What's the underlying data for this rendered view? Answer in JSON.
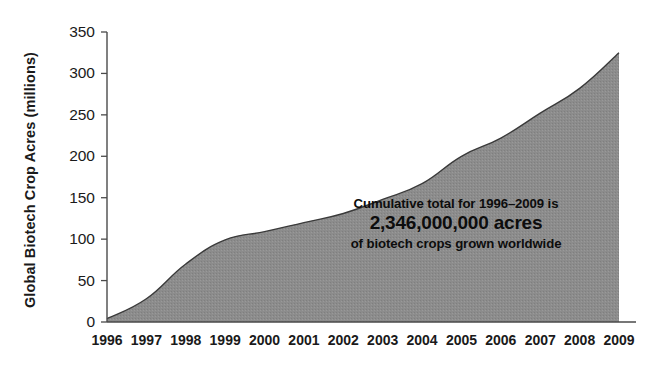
{
  "chart_data": {
    "type": "area",
    "title": "",
    "xlabel": "",
    "ylabel": "Global Biotech Crop Acres (millions)",
    "categories": [
      "1996",
      "1997",
      "1998",
      "1999",
      "2000",
      "2001",
      "2002",
      "2003",
      "2004",
      "2005",
      "2006",
      "2007",
      "2008",
      "2009"
    ],
    "values": [
      4,
      28,
      70,
      99,
      109,
      120,
      131,
      148,
      167,
      200,
      222,
      252,
      282,
      325
    ],
    "series": [
      {
        "name": "Global Biotech Crop Acres (millions)",
        "values": [
          4,
          28,
          70,
          99,
          109,
          120,
          131,
          148,
          167,
          200,
          222,
          252,
          282,
          325
        ]
      }
    ],
    "ylim": [
      0,
      350
    ],
    "yticks": [
      0,
      50,
      100,
      150,
      200,
      250,
      300,
      350
    ],
    "ytick_labels": [
      "0",
      "50",
      "100",
      "150",
      "200",
      "250",
      "300",
      "350"
    ],
    "xtick_labels": [
      "1996",
      "1997",
      "1998",
      "1999",
      "2000",
      "2001",
      "2002",
      "2003",
      "2004",
      "2005",
      "2006",
      "2007",
      "2008",
      "2009"
    ],
    "grid": false,
    "legend": false,
    "legend_position": "none",
    "fill_color": "#8c8c8c",
    "line_color": "#3a3a3a",
    "axis_color": "#4a4a4a",
    "background_color": "#ffffff",
    "annotations": [
      {
        "line1": "Cumulative total for 1996–2009 is",
        "line2": "2,346,000,000 acres",
        "line3": "of biotech crops grown worldwide"
      }
    ]
  },
  "axis": {
    "y_title": "Global Biotech Crop Acres (millions)"
  }
}
